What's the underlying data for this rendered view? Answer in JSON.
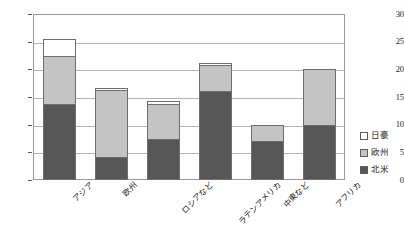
{
  "chart_data": {
    "type": "bar",
    "stacked": true,
    "title": "",
    "subtitle": "",
    "xlabel": "",
    "ylabel": "",
    "ylim": [
      0,
      30
    ],
    "ytick_values": [
      0,
      5,
      10,
      15,
      20,
      25,
      30
    ],
    "ytick_labels": [
      "0",
      "5",
      "10",
      "15",
      "20",
      "25",
      "30"
    ],
    "grid": true,
    "grid_axis": "y",
    "legend_position": "right",
    "categories": [
      "アジア",
      "欧州",
      "ロシアなど",
      "ラテンアメリカ",
      "中東など",
      "アフリカ"
    ],
    "series": [
      {
        "name": "北米",
        "color": "#575757",
        "values": [
          13.7,
          4.2,
          7.5,
          16.1,
          7.0,
          10.0
        ]
      },
      {
        "name": "欧州",
        "color": "#c4c4c4",
        "values": [
          8.7,
          12.0,
          6.3,
          4.7,
          3.0,
          10.0
        ]
      },
      {
        "name": "日豪",
        "color": "#ffffff",
        "values": [
          3.0,
          0.5,
          0.5,
          0.4,
          0.0,
          0.0
        ]
      }
    ],
    "totals": [
      25.4,
      16.7,
      14.3,
      21.2,
      10.0,
      20.0
    ]
  },
  "legend": {
    "items": [
      {
        "label": "日豪",
        "color": "#ffffff"
      },
      {
        "label": "欧州",
        "color": "#c4c4c4"
      },
      {
        "label": "北米",
        "color": "#575757"
      }
    ]
  },
  "axis": {
    "y_labels": [
      "30",
      "25",
      "20",
      "15",
      "10",
      "5",
      "0"
    ]
  },
  "colors": {
    "axis_line": "#9a9a9a",
    "gridline": "#b4b4b4",
    "bar_outline": "#6e6e6e",
    "text": "#1b1b1b",
    "background": "#ffffff"
  }
}
